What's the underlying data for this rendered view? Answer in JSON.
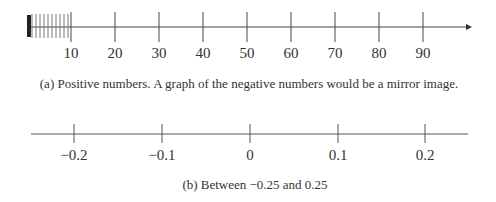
{
  "figure_a": {
    "caption": "(a) Positive numbers. A graph of the negative numbers would be a mirror image.",
    "ticks": [
      {
        "label": "10",
        "x": 71
      },
      {
        "label": "20",
        "x": 115
      },
      {
        "label": "30",
        "x": 159
      },
      {
        "label": "40",
        "x": 203
      },
      {
        "label": "50",
        "x": 247
      },
      {
        "label": "60",
        "x": 291
      },
      {
        "label": "70",
        "x": 335
      },
      {
        "label": "80",
        "x": 379
      },
      {
        "label": "90",
        "x": 423
      }
    ],
    "dense_ticks_x": [
      32,
      36,
      40,
      44,
      48,
      52,
      56,
      60,
      64,
      68
    ]
  },
  "figure_b": {
    "caption": "(b) Between −0.25 and 0.25",
    "ticks": [
      {
        "label": "−0.2",
        "x": 74
      },
      {
        "label": "−0.1",
        "x": 162
      },
      {
        "label": "0",
        "x": 250
      },
      {
        "label": "0.1",
        "x": 338
      },
      {
        "label": "0.2",
        "x": 425
      }
    ]
  }
}
